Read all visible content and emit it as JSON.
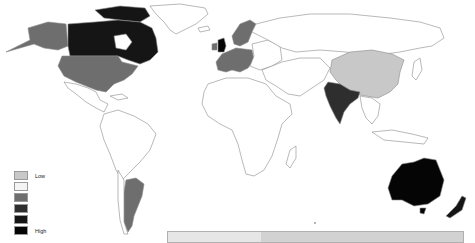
{
  "map": {
    "type": "choropleth-world",
    "colors": {
      "background": "#ffffff",
      "border": "#8a8a8a",
      "no_data": "#ffffff",
      "level_1": "#c8c8c8",
      "level_2": "#f4f4f4",
      "level_3": "#6e6e6e",
      "level_4": "#2e2e2e",
      "level_5": "#151515",
      "level_6": "#050505"
    },
    "regions": [
      {
        "name": "Canada",
        "level": "level_5"
      },
      {
        "name": "United States",
        "level": "level_3"
      },
      {
        "name": "Alaska",
        "level": "level_3"
      },
      {
        "name": "United Kingdom",
        "level": "level_6"
      },
      {
        "name": "Western Europe",
        "level": "level_3"
      },
      {
        "name": "Scandinavia",
        "level": "level_3"
      },
      {
        "name": "India",
        "level": "level_4"
      },
      {
        "name": "China",
        "level": "level_1"
      },
      {
        "name": "Argentina",
        "level": "level_3"
      },
      {
        "name": "Australia",
        "level": "level_6"
      },
      {
        "name": "New Zealand",
        "level": "level_5"
      }
    ]
  },
  "legend": {
    "low_label": "Low",
    "high_label": "High",
    "swatches": [
      "#c8c8c8",
      "#f4f4f4",
      "#6e6e6e",
      "#2e2e2e",
      "#151515",
      "#050505"
    ]
  },
  "bottom_panel": {
    "left_color": "#e6e6e6",
    "right_color": "#d2d2d2"
  }
}
